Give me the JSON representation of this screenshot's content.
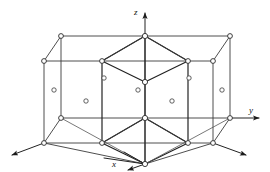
{
  "figure": {
    "title": "Hexagonal close-packed crystal lattice unit cell",
    "background_color": "#ffffff",
    "line_color": "#2a2a2a",
    "atom_fill_color": "#ffffff"
  },
  "axes": [
    {
      "id": "z",
      "label": "z",
      "direction": "up",
      "arrow": true
    },
    {
      "id": "y",
      "label": "y",
      "direction": "right",
      "arrow": true
    },
    {
      "id": "x",
      "label": "x",
      "direction": "down-right-front",
      "arrow": true
    },
    {
      "id": "x-neg",
      "label": "",
      "direction": "down-left",
      "arrow": true
    }
  ],
  "geometry": {
    "projection": "oblique",
    "depth_offset_x": -34,
    "depth_offset_y": 38,
    "prism_height": 82,
    "hexagon_half_width": 86,
    "hexagon_inner_half_width": 43
  },
  "lattice": {
    "type": "hexagonal-close-packed",
    "corner_atom_count": 12,
    "face_center_atom_count": 2,
    "interior_atom_count": 7,
    "total_visible_atoms": 21,
    "corner_atom_radius": 2.4,
    "interior_atom_radius": 2.2
  },
  "vertices": {
    "top_back_left": {
      "x": 61,
      "y": 36
    },
    "top_back_right": {
      "x": 230,
      "y": 36
    },
    "top_mid_back": {
      "x": 145,
      "y": 36
    },
    "top_front_left": {
      "x": 44,
      "y": 61
    },
    "top_front_right": {
      "x": 213,
      "y": 61
    },
    "top_hex_left": {
      "x": 102,
      "y": 61
    },
    "top_hex_right": {
      "x": 188,
      "y": 61
    },
    "top_hex_front": {
      "x": 145,
      "y": 82
    },
    "bot_back_left": {
      "x": 61,
      "y": 118
    },
    "bot_back_right": {
      "x": 230,
      "y": 118
    },
    "bot_mid_back": {
      "x": 145,
      "y": 118
    },
    "bot_front_left": {
      "x": 44,
      "y": 143
    },
    "bot_front_right": {
      "x": 213,
      "y": 143
    },
    "bot_hex_left": {
      "x": 102,
      "y": 143
    },
    "bot_hex_right": {
      "x": 188,
      "y": 143
    },
    "bot_hex_front": {
      "x": 145,
      "y": 164
    }
  },
  "interior_atoms": [
    {
      "x": 54,
      "y": 90
    },
    {
      "x": 86,
      "y": 101
    },
    {
      "x": 104,
      "y": 78
    },
    {
      "x": 138,
      "y": 90
    },
    {
      "x": 172,
      "y": 101
    },
    {
      "x": 189,
      "y": 78
    },
    {
      "x": 222,
      "y": 90
    }
  ]
}
